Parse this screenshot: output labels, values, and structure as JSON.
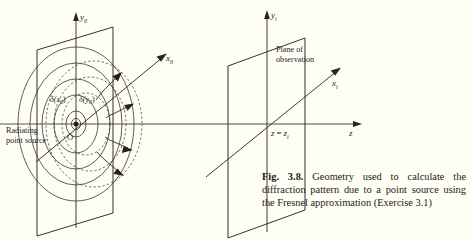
{
  "figure": {
    "number": "Fig. 3.8.",
    "caption_text": "Geometry used to calculate the diffraction pattern due to a point source using the Fresnel approximation (Exercise 3.1)",
    "background_color": "#fffef5",
    "ink_color": "#241f1c"
  },
  "left_panel": {
    "name": "source plane",
    "axes": {
      "vertical": {
        "symbol": "y",
        "subscript": "0"
      },
      "depth": {
        "symbol": "x",
        "subscript": "0"
      }
    },
    "source_label_line1": "Radiating",
    "source_label_line2": "point source",
    "origin_label": "O",
    "delta_x": {
      "symbol": "δ",
      "arg": "(x",
      "sub": "0",
      "close": ")"
    },
    "delta_y": {
      "symbol": "δ",
      "arg": "(y",
      "sub": "0",
      "close": ")"
    },
    "wavefront_count": 5,
    "dashed_wavefront_count": 2,
    "ray_arrow_count": 4
  },
  "right_panel": {
    "name": "observation plane",
    "axes": {
      "vertical": {
        "symbol": "y",
        "subscript": "i"
      },
      "depth": {
        "symbol": "x",
        "subscript": "i"
      },
      "horizontal": {
        "symbol": "z"
      }
    },
    "plane_label_line1": "Plane of",
    "plane_label_line2": "observation",
    "position_label": {
      "lhs": "z",
      "eq": "=",
      "rhs": "z",
      "sub": "i"
    }
  }
}
